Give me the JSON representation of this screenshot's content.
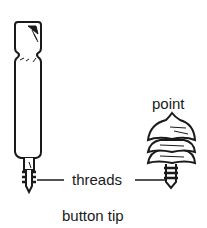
{
  "diagram": {
    "caption": "button tip",
    "labels": {
      "point": "point",
      "threads": "threads"
    },
    "parts": [
      {
        "name": "shaft",
        "description": "tall rod with notched head and threaded tip"
      },
      {
        "name": "button-tip",
        "description": "stacked conical tip with threaded stem"
      }
    ],
    "colors": {
      "ink": "#1a1a1a",
      "background": "#ffffff"
    }
  }
}
